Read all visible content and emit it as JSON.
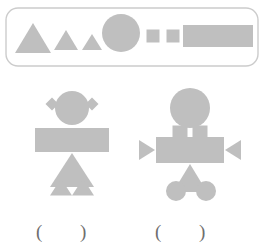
{
  "page": {
    "background": "#ffffff",
    "width": 264,
    "height": 250
  },
  "palette": {
    "shape_fill": "#bfbfbf",
    "legend_border": "#cccccc",
    "legend_fill": "#ffffff",
    "paren_color": "#6e6e6e"
  },
  "legend": {
    "name": "shape-legend-bar",
    "border_radius": 12,
    "shapes": [
      {
        "id": "triangle-large",
        "type": "triangle",
        "label": "large triangle",
        "cx": 33,
        "cy": 38,
        "width": 36,
        "height": 30
      },
      {
        "id": "triangle-medium",
        "type": "triangle",
        "label": "medium triangle",
        "cx": 66,
        "cy": 40,
        "width": 24,
        "height": 20
      },
      {
        "id": "triangle-small",
        "type": "triangle",
        "label": "small triangle",
        "cx": 92,
        "cy": 42,
        "width": 20,
        "height": 16
      },
      {
        "id": "circle-large",
        "type": "circle",
        "label": "large circle",
        "cx": 121,
        "cy": 33,
        "r": 19
      },
      {
        "id": "square-small-1",
        "type": "square",
        "label": "small square",
        "cx": 153,
        "cy": 36,
        "size": 13
      },
      {
        "id": "square-small-2",
        "type": "square",
        "label": "small square",
        "cx": 173,
        "cy": 36,
        "size": 13
      },
      {
        "id": "rectangle-large",
        "type": "rectangle",
        "label": "large rectangle",
        "cx": 218,
        "cy": 36,
        "width": 70,
        "height": 22
      }
    ]
  },
  "figures": [
    {
      "name": "figure-left",
      "parts": [
        {
          "id": "left-ear-diamond",
          "type": "diamond",
          "label": "left diamond ear",
          "cx": 52,
          "cy": 104,
          "size": 13
        },
        {
          "id": "right-ear-diamond",
          "type": "diamond",
          "label": "right diamond ear",
          "cx": 92,
          "cy": 104,
          "size": 13
        },
        {
          "id": "head-circle",
          "type": "circle",
          "label": "head circle",
          "cx": 72,
          "cy": 108,
          "r": 17
        },
        {
          "id": "body-rectangle",
          "type": "rectangle",
          "label": "body rectangle",
          "cx": 72,
          "cy": 140,
          "width": 74,
          "height": 24
        },
        {
          "id": "leg-triangle-big",
          "type": "triangle",
          "label": "large leg triangle",
          "cx": 72,
          "cy": 170,
          "width": 44,
          "height": 34
        },
        {
          "id": "foot-triangle-left",
          "type": "triangle",
          "label": "left foot triangle",
          "cx": 61,
          "cy": 187,
          "width": 22,
          "height": 17
        },
        {
          "id": "foot-triangle-right",
          "type": "triangle",
          "label": "right foot triangle",
          "cx": 83,
          "cy": 187,
          "width": 22,
          "height": 17
        }
      ]
    },
    {
      "name": "figure-right",
      "parts": [
        {
          "id": "head-circle",
          "type": "circle",
          "label": "head circle",
          "cx": 190,
          "cy": 108,
          "r": 20
        },
        {
          "id": "neck-square-left",
          "type": "square",
          "label": "left neck square",
          "cx": 180,
          "cy": 133,
          "size": 15
        },
        {
          "id": "neck-square-right",
          "type": "square",
          "label": "right neck square",
          "cx": 200,
          "cy": 133,
          "size": 15
        },
        {
          "id": "body-rectangle",
          "type": "rectangle",
          "label": "body rectangle",
          "cx": 190,
          "cy": 150,
          "width": 68,
          "height": 26
        },
        {
          "id": "arm-triangle-left",
          "type": "triangle-right",
          "label": "left arm triangle",
          "cx": 147,
          "cy": 150,
          "width": 16,
          "height": 20
        },
        {
          "id": "arm-triangle-right",
          "type": "triangle-left",
          "label": "right arm triangle",
          "cx": 233,
          "cy": 150,
          "width": 16,
          "height": 20
        },
        {
          "id": "leg-triangle",
          "type": "triangle",
          "label": "leg triangle",
          "cx": 190,
          "cy": 178,
          "width": 34,
          "height": 28
        },
        {
          "id": "foot-circle-left",
          "type": "circle",
          "label": "left foot circle",
          "cx": 176,
          "cy": 191,
          "r": 10
        },
        {
          "id": "foot-circle-right",
          "type": "circle",
          "label": "right foot circle",
          "cx": 206,
          "cy": 191,
          "r": 10
        }
      ]
    }
  ],
  "answer_slots": [
    {
      "name": "answer-slot-left",
      "open": "(",
      "close": ")",
      "x_open": 36,
      "x_close": 80,
      "y": 222
    },
    {
      "name": "answer-slot-right",
      "open": "(",
      "close": ")",
      "x_open": 155,
      "x_close": 199,
      "y": 222
    }
  ]
}
